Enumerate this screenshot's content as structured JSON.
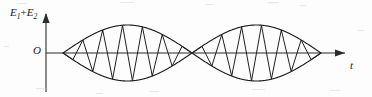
{
  "figure": {
    "kind": "physics-waveform-diagram",
    "background_color": "#fdfdfd",
    "ink_color": "#1f1f1f",
    "labels": {
      "y_axis_main": "E",
      "y_axis_sub1": "1",
      "y_axis_plus": "+",
      "y_axis_main2": "E",
      "y_axis_sub2": "2",
      "y_axis_full": "E1+E2",
      "origin": "O",
      "x_axis": "t"
    }
  },
  "chart_data": {
    "type": "line",
    "title": "",
    "xlabel": "t",
    "ylabel": "E1+E2",
    "grid": false,
    "legend": false,
    "axes": {
      "origin_px": {
        "x": 46,
        "y": 53
      },
      "x_axis_start_px": 46,
      "x_axis_end_px": 345,
      "y_axis_top_px": 13,
      "y_axis_bottom_px": 92,
      "wave_start_px": 63,
      "wave_end_px": 321,
      "node_px": 192,
      "envelope_peak_top_px": 25,
      "envelope_peak_bottom_px": 81
    },
    "series": [
      {
        "name": "envelope-upper",
        "role": "amplitude envelope (positive)",
        "formula": "A*|cos(pi*(x-x0)/L)|",
        "amplitude": 28,
        "lobes": 2
      },
      {
        "name": "envelope-lower",
        "role": "amplitude envelope (negative)",
        "formula": "-A*|cos(pi*(x-x0)/L)|",
        "amplitude": 28,
        "lobes": 2
      },
      {
        "name": "carrier",
        "role": "resultant oscillation drawn as zigzag segments",
        "cycles_per_lobe": 6.5,
        "total_cycles": 13
      }
    ],
    "annotations": [
      {
        "text": "E1+E2",
        "position": "y-axis-top"
      },
      {
        "text": "O",
        "position": "origin"
      },
      {
        "text": "t",
        "position": "x-axis-end"
      }
    ]
  }
}
